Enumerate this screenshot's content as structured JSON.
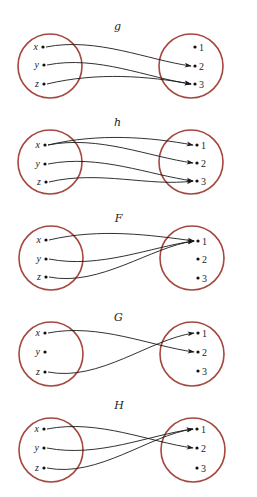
{
  "figure": {
    "circle_color": "#a5473d",
    "arrow_color": "#1a1a1a",
    "diagrams": [
      {
        "title": "g",
        "title_y": 30,
        "left_center": [
          50,
          66
        ],
        "right_center": [
          191,
          66
        ],
        "radius": 32,
        "domain": [
          {
            "label": "x",
            "pos": [
              43,
              47
            ]
          },
          {
            "label": "y",
            "pos": [
              44,
              65
            ]
          },
          {
            "label": "z",
            "pos": [
              44,
              84
            ]
          }
        ],
        "codomain": [
          {
            "label": "1",
            "pos": [
              195,
              47
            ]
          },
          {
            "label": "2",
            "pos": [
              195,
              66
            ]
          },
          {
            "label": "3",
            "pos": [
              195,
              84
            ]
          }
        ],
        "mappings": [
          {
            "from": "x",
            "to": "2"
          },
          {
            "from": "y",
            "to": "3"
          },
          {
            "from": "z",
            "to": "3"
          }
        ]
      },
      {
        "title": "h",
        "title_y": 126,
        "left_center": [
          50,
          162
        ],
        "right_center": [
          191,
          162
        ],
        "radius": 32,
        "domain": [
          {
            "label": "x",
            "pos": [
              45,
              145
            ]
          },
          {
            "label": "y",
            "pos": [
              45,
              164
            ]
          },
          {
            "label": "z",
            "pos": [
              46,
              182
            ]
          }
        ],
        "codomain": [
          {
            "label": "1",
            "pos": [
              197,
              145
            ]
          },
          {
            "label": "2",
            "pos": [
              197,
              163
            ]
          },
          {
            "label": "3",
            "pos": [
              197,
              181
            ]
          }
        ],
        "mappings": [
          {
            "from": "x",
            "to": "1"
          },
          {
            "from": "x",
            "to": "2"
          },
          {
            "from": "y",
            "to": "3"
          },
          {
            "from": "z",
            "to": "3"
          }
        ]
      },
      {
        "title": "F",
        "title_y": 222,
        "left_center": [
          51,
          258
        ],
        "right_center": [
          192,
          258
        ],
        "radius": 32,
        "domain": [
          {
            "label": "x",
            "pos": [
              46,
              240
            ]
          },
          {
            "label": "y",
            "pos": [
              46,
              259
            ]
          },
          {
            "label": "z",
            "pos": [
              46,
              277
            ]
          }
        ],
        "codomain": [
          {
            "label": "1",
            "pos": [
              198,
              241
            ]
          },
          {
            "label": "2",
            "pos": [
              198,
              259
            ]
          },
          {
            "label": "3",
            "pos": [
              198,
              278
            ]
          }
        ],
        "mappings": [
          {
            "from": "x",
            "to": "1"
          },
          {
            "from": "y",
            "to": "1"
          },
          {
            "from": "z",
            "to": "1"
          }
        ]
      },
      {
        "title": "G",
        "title_y": 321,
        "left_center": [
          51,
          354
        ],
        "right_center": [
          192,
          354
        ],
        "radius": 32,
        "domain": [
          {
            "label": "x",
            "pos": [
              45,
              333
            ]
          },
          {
            "label": "y",
            "pos": [
              45,
              352
            ]
          },
          {
            "label": "z",
            "pos": [
              45,
              372
            ]
          }
        ],
        "codomain": [
          {
            "label": "1",
            "pos": [
              198,
              333
            ]
          },
          {
            "label": "2",
            "pos": [
              198,
              352
            ]
          },
          {
            "label": "3",
            "pos": [
              198,
              371
            ]
          }
        ],
        "mappings": [
          {
            "from": "x",
            "to": "2"
          },
          {
            "from": "z",
            "to": "1"
          }
        ]
      },
      {
        "title": "H",
        "title_y": 409,
        "left_center": [
          51,
          450
        ],
        "right_center": [
          193,
          450
        ],
        "radius": 32,
        "domain": [
          {
            "label": "x",
            "pos": [
              44,
              429
            ]
          },
          {
            "label": "y",
            "pos": [
              44,
              448
            ]
          },
          {
            "label": "z",
            "pos": [
              44,
              468
            ]
          }
        ],
        "codomain": [
          {
            "label": "1",
            "pos": [
              197,
              429
            ]
          },
          {
            "label": "2",
            "pos": [
              197,
              448
            ]
          },
          {
            "label": "3",
            "pos": [
              197,
              468
            ]
          }
        ],
        "mappings": [
          {
            "from": "x",
            "to": "2"
          },
          {
            "from": "y",
            "to": "1"
          },
          {
            "from": "z",
            "to": "1"
          }
        ]
      }
    ]
  }
}
